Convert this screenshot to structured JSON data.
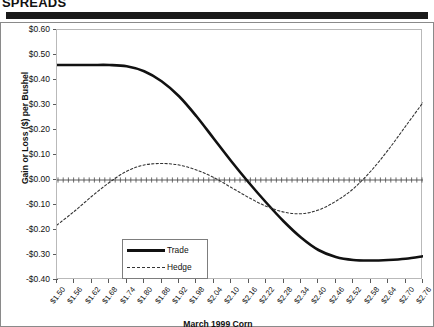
{
  "header": {
    "title": "SPREADS"
  },
  "chart_data": {
    "type": "line",
    "title": "",
    "xlabel": "March 1999 Corn",
    "ylabel": "Gain or Loss ($) per Bushel",
    "ylim": [
      -0.4,
      0.6
    ],
    "ytick_step": 0.1,
    "ytick_labels": [
      "$0.60",
      "$0.50",
      "$0.40",
      "$0.30",
      "$0.20",
      "$0.10",
      "$0.00",
      "-$0.10",
      "-$0.20",
      "-$0.30",
      "-$0.40"
    ],
    "ytick_values": [
      0.6,
      0.5,
      0.4,
      0.3,
      0.2,
      0.1,
      0.0,
      -0.1,
      -0.2,
      -0.3,
      -0.4
    ],
    "xlim": [
      1.5,
      2.76
    ],
    "xtick_step": 0.06,
    "categories": [
      "$1.50",
      "$1.56",
      "$1.62",
      "$1.68",
      "$1.74",
      "$1.80",
      "$1.86",
      "$1.92",
      "$1.98",
      "$2.04",
      "$2.10",
      "$2.16",
      "$2.22",
      "$2.28",
      "$2.34",
      "$2.40",
      "$2.46",
      "$2.52",
      "$2.58",
      "$2.64",
      "$2.70",
      "$2.76"
    ],
    "x": [
      1.5,
      1.56,
      1.62,
      1.68,
      1.74,
      1.8,
      1.86,
      1.92,
      1.98,
      2.04,
      2.1,
      2.16,
      2.22,
      2.28,
      2.34,
      2.4,
      2.46,
      2.52,
      2.58,
      2.64,
      2.7,
      2.76
    ],
    "grid": false,
    "zero_line": true,
    "legend_position": "inside-left-lower",
    "series": [
      {
        "name": "Trade",
        "style": "solid",
        "width": 2.6,
        "color": "#111111",
        "values": [
          0.46,
          0.46,
          0.46,
          0.46,
          0.455,
          0.435,
          0.395,
          0.335,
          0.255,
          0.165,
          0.075,
          -0.01,
          -0.09,
          -0.165,
          -0.23,
          -0.28,
          -0.308,
          -0.32,
          -0.322,
          -0.32,
          -0.315,
          -0.305
        ]
      },
      {
        "name": "Hedge",
        "style": "dotted",
        "width": 1.1,
        "color": "#333333",
        "values": [
          -0.18,
          -0.125,
          -0.065,
          -0.01,
          0.035,
          0.06,
          0.066,
          0.06,
          0.04,
          0.01,
          -0.03,
          -0.07,
          -0.105,
          -0.128,
          -0.135,
          -0.12,
          -0.085,
          -0.035,
          0.035,
          0.12,
          0.215,
          0.31
        ]
      }
    ],
    "legend": [
      {
        "label": "Trade",
        "style": "solid"
      },
      {
        "label": "Hedge",
        "style": "dotted"
      }
    ]
  }
}
